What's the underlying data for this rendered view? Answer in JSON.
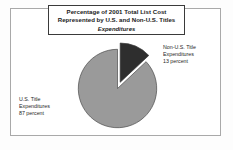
{
  "figure": {
    "title_lines": [
      "Percentage of 2001 Total List Cost",
      "Represented by U.S. and Non-U.S. Titles",
      "Expenditures"
    ],
    "labels": {
      "non_us": {
        "line1": "Non-U.S. Title",
        "line2": "Expenditures",
        "line3": "13 percent"
      },
      "us": {
        "line1": "U.S. Title",
        "line2": "Expenditures",
        "line3": "87 percent"
      }
    },
    "colors": {
      "us_slice": "#9a9a9a",
      "non_us_slice": "#2e2e2e",
      "slice_outline": "#4a4a4a",
      "frame": "#a9a9a9",
      "title_border": "#3a3a3a",
      "background": "#ffffff"
    }
  },
  "chart_data": {
    "type": "pie",
    "title": "Percentage of 2001 Total List Cost Represented by U.S. and Non-U.S. Titles Expenditures",
    "categories": [
      "U.S. Title Expenditures",
      "Non-U.S. Title Expenditures"
    ],
    "values": [
      87,
      13
    ],
    "value_unit": "percent",
    "labels": [
      "87 percent",
      "13 percent"
    ],
    "colors": [
      "#9a9a9a",
      "#2e2e2e"
    ],
    "exploded": [
      false,
      true
    ],
    "start_angle_deg": 0,
    "direction": "clockwise",
    "legend": "none",
    "annotations": [
      "U.S. Title Expenditures 87 percent",
      "Non-U.S. Title Expenditures 13 percent"
    ],
    "xlabel": "",
    "ylabel": ""
  }
}
